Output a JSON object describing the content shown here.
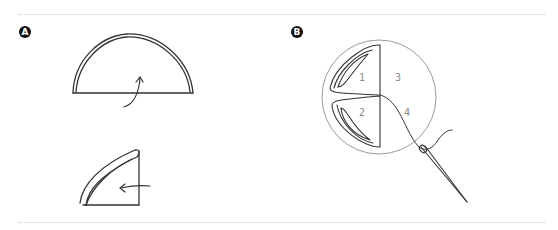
{
  "figure": {
    "panel_a": {
      "label": "A"
    },
    "panel_b": {
      "label": "B",
      "sections": [
        "1",
        "2",
        "3",
        "4"
      ]
    }
  },
  "colors": {
    "ink": "#333333",
    "circle": "#9a9a9a",
    "divider": "#c8c8c8",
    "numbers": "#8a8a8a"
  }
}
